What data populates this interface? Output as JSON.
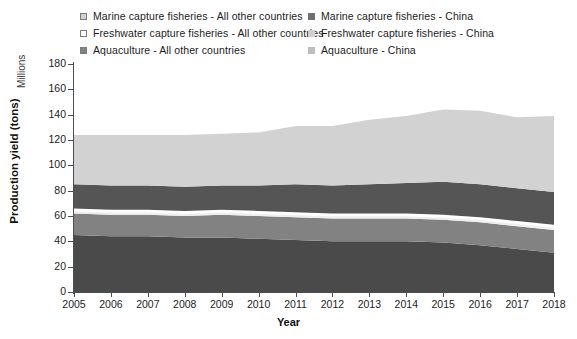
{
  "legend": {
    "columns": [
      {
        "items": [
          {
            "label": "Marine capture fisheries - All other countries",
            "color": "#d2d2d2",
            "swatch": "filled-square-marker"
          },
          {
            "label": "Freshwater capture fisheries - All other countries",
            "color": "#ffffff",
            "swatch": "open-square-marker"
          },
          {
            "label": "Aquaculture - All other countries",
            "color": "#828282",
            "swatch": "filled-square-marker"
          }
        ]
      },
      {
        "items": [
          {
            "label": "Marine capture fisheries - China",
            "color": "#555555",
            "swatch": "filled-square-marker"
          },
          {
            "label": "Freshwater capture fisheries - China",
            "color": "#efefef",
            "swatch": "filled-square-marker"
          },
          {
            "label": "Aquaculture - China",
            "color": "#4a4a4a",
            "swatch": "filled-square-marker"
          }
        ]
      }
    ]
  },
  "axes": {
    "y_title": "Production yield (tons)",
    "y_units": "Millions",
    "x_title": "Year",
    "y_ticks": [
      "0",
      "20",
      "40",
      "60",
      "80",
      "100",
      "120",
      "140",
      "160",
      "180"
    ],
    "x_ticks": [
      "2005",
      "2006",
      "2007",
      "2008",
      "2009",
      "2010",
      "2011",
      "2012",
      "2013",
      "2014",
      "2015",
      "2016",
      "2017",
      "2018"
    ]
  },
  "chart_data": {
    "type": "area",
    "title": "",
    "xlabel": "Year",
    "ylabel": "Production yield (tons)",
    "yunits": "Millions",
    "ylim": [
      0,
      180
    ],
    "grid": false,
    "legend_position": "top",
    "stacked": true,
    "x": [
      2005,
      2006,
      2007,
      2008,
      2009,
      2010,
      2011,
      2012,
      2013,
      2014,
      2015,
      2016,
      2017,
      2018
    ],
    "series": [
      {
        "name": "Aquaculture - China",
        "color": "#4a4a4a",
        "values": [
          45,
          44,
          44,
          43,
          43,
          42,
          41,
          40,
          40,
          40,
          39,
          37,
          34,
          31
        ]
      },
      {
        "name": "Aquaculture - All other countries",
        "color": "#828282",
        "values": [
          17,
          17,
          17,
          17,
          18,
          18,
          18,
          18,
          18,
          18,
          18,
          18,
          18,
          18
        ]
      },
      {
        "name": "Freshwater capture fisheries - China",
        "color": "#efefef",
        "values": [
          2,
          2,
          2,
          2,
          2,
          2,
          2,
          2,
          2,
          2,
          2,
          2,
          2,
          2
        ]
      },
      {
        "name": "Freshwater capture fisheries - All other countries",
        "color": "#ffffff",
        "values": [
          2,
          2,
          2,
          2,
          2,
          2,
          2,
          2,
          2,
          2,
          2,
          2,
          2,
          2
        ]
      },
      {
        "name": "Marine capture fisheries - China",
        "color": "#555555",
        "values": [
          19,
          19,
          19,
          19,
          19,
          20,
          22,
          22,
          23,
          24,
          26,
          26,
          26,
          26
        ]
      },
      {
        "name": "Marine capture fisheries - All other countries",
        "color": "#d2d2d2",
        "values": [
          39,
          40,
          40,
          41,
          41,
          42,
          46,
          47,
          51,
          53,
          57,
          58,
          56,
          60
        ]
      }
    ],
    "totals": [
      124,
      124,
      124,
      124,
      125,
      126,
      131,
      131,
      136,
      139,
      144,
      143,
      140,
      141
    ]
  }
}
